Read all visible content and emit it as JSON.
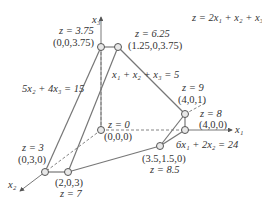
{
  "objective": "z = 2x₁ + x₂ + x₃",
  "axes": {
    "x1": "x₁",
    "x2": "x₂",
    "x3": "x₃"
  },
  "constraints": [
    {
      "label": "5x₂ + 4x₃ = 15"
    },
    {
      "label": "x₁ + x₂ + x₃ = 5"
    },
    {
      "label": "6x₁ + 2x₂ = 24"
    }
  ],
  "vertices": [
    {
      "point": "(0,0,0)",
      "z": "z = 0"
    },
    {
      "point": "(0,0,3.75)",
      "z": "z = 3.75"
    },
    {
      "point": "(1.25,0,3.75)",
      "z": "z = 6.25"
    },
    {
      "point": "(4,0,1)",
      "z": "z = 9"
    },
    {
      "point": "(4,0,0)",
      "z": "z = 8"
    },
    {
      "point": "(3.5,1.5,0)",
      "z": "z = 8.5"
    },
    {
      "point": "(0,3,0)",
      "z": "z = 3"
    },
    {
      "point": "(2,0,3)",
      "z": "z = 7"
    }
  ]
}
